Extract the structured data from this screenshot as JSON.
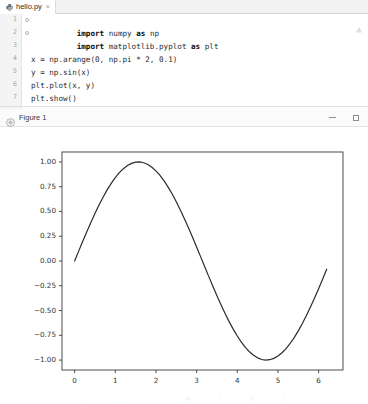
{
  "editor": {
    "tab": {
      "filename": "hello.py",
      "icon": "python-file-icon",
      "close": "×"
    },
    "gutter_numbers": [
      "1",
      "2",
      "3",
      "4",
      "5",
      "6",
      "7"
    ],
    "lines": [
      {
        "n": "1",
        "text": "import numpy as np"
      },
      {
        "n": "2",
        "text": "import matplotlib.pyplot as plt"
      },
      {
        "n": "3",
        "text": ""
      },
      {
        "n": "4",
        "text": "x = np.arange(0, np.pi * 2, 0.1)"
      },
      {
        "n": "5",
        "text": "y = np.sin(x)"
      },
      {
        "n": "6",
        "text": "plt.plot(x, y)"
      },
      {
        "n": "7",
        "text": "plt.show()"
      }
    ],
    "inspection_icon": "inspection-warning-icon"
  },
  "figure_window": {
    "icon": "matplotlib-icon",
    "title": "Figure 1",
    "minimize_label": "—",
    "maximize_label": "□"
  },
  "chart_data": {
    "type": "line",
    "title": "",
    "xlabel": "",
    "ylabel": "",
    "xlim": [
      -0.31,
      6.6
    ],
    "ylim": [
      -1.1,
      1.1
    ],
    "xticks": [
      0,
      1,
      2,
      3,
      4,
      5,
      6
    ],
    "xtick_labels": [
      "0",
      "1",
      "2",
      "3",
      "4",
      "5",
      "6"
    ],
    "yticks": [
      -1.0,
      -0.75,
      -0.5,
      -0.25,
      0.0,
      0.25,
      0.5,
      0.75,
      1.0
    ],
    "ytick_labels": [
      "−1.00",
      "−0.75",
      "−0.50",
      "−0.25",
      "0.00",
      "0.25",
      "0.50",
      "0.75",
      "1.00"
    ],
    "grid": false,
    "legend": false,
    "line_color": "#2b2b2b",
    "line_width": 1.2,
    "series": [
      {
        "name": "y = np.sin(x)",
        "expression": "sin(x)",
        "x_start": 0.0,
        "x_stop": 6.2832,
        "x_step": 0.1,
        "x": [
          0.0,
          0.1,
          0.2,
          0.3,
          0.4,
          0.5,
          0.6,
          0.7,
          0.8,
          0.9,
          1.0,
          1.1,
          1.2,
          1.3,
          1.4,
          1.5,
          1.6,
          1.7,
          1.8,
          1.9,
          2.0,
          2.1,
          2.2,
          2.3,
          2.4,
          2.5,
          2.6,
          2.7,
          2.8,
          2.9,
          3.0,
          3.1,
          3.2,
          3.3,
          3.4,
          3.5,
          3.6,
          3.7,
          3.8,
          3.9,
          4.0,
          4.1,
          4.2,
          4.3,
          4.4,
          4.5,
          4.6,
          4.7,
          4.8,
          4.9,
          5.0,
          5.1,
          5.2,
          5.3,
          5.4,
          5.5,
          5.6,
          5.7,
          5.8,
          5.9,
          6.0,
          6.1,
          6.2
        ],
        "y": [
          0.0,
          0.0998,
          0.1987,
          0.2955,
          0.3894,
          0.4794,
          0.5646,
          0.6442,
          0.7174,
          0.7833,
          0.8415,
          0.8912,
          0.932,
          0.9636,
          0.9854,
          0.9975,
          0.9996,
          0.9917,
          0.9738,
          0.9463,
          0.9093,
          0.8632,
          0.8085,
          0.7457,
          0.6755,
          0.5985,
          0.5155,
          0.4274,
          0.335,
          0.2392,
          0.1411,
          0.0416,
          -0.0584,
          -0.1577,
          -0.2555,
          -0.3508,
          -0.4425,
          -0.5298,
          -0.6119,
          -0.6878,
          -0.7568,
          -0.8183,
          -0.8716,
          -0.9162,
          -0.9516,
          -0.9775,
          -0.9937,
          -0.9999,
          -0.9962,
          -0.9825,
          -0.9589,
          -0.9258,
          -0.8835,
          -0.8323,
          -0.7728,
          -0.7055,
          -0.6313,
          -0.5507,
          -0.4646,
          -0.3739,
          -0.2794,
          -0.1822,
          -0.0831
        ]
      }
    ]
  },
  "toolbar_ghost": [
    "⌂",
    "←",
    "→",
    "✚",
    "⌕",
    "⚙",
    "⤓"
  ]
}
